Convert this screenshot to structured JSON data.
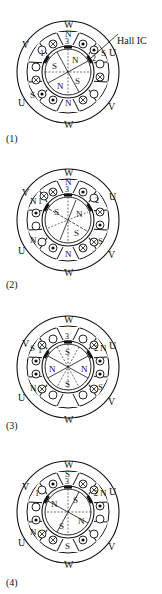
{
  "top_text": "",
  "hall_label": "Hall IC",
  "colors": {
    "ink": "#111111",
    "background": "#ffffff"
  },
  "panels": [
    {
      "caption": "(1)",
      "stator_labels": {
        "top": "W",
        "bottom": "W",
        "upper_left": "V",
        "lower_left": "U",
        "upper_right": "U",
        "lower_right": "V"
      },
      "pole_letters": {
        "top": "N",
        "bottom": "N",
        "upper_left": "",
        "lower_left": "S",
        "upper_right": "S",
        "lower_right": ""
      },
      "sensor_numbers": [
        "1",
        "2",
        "3"
      ],
      "rotor_poles": [
        "S",
        "N",
        "S",
        "N"
      ]
    },
    {
      "caption": "(2)",
      "stator_labels": {
        "top": "W",
        "bottom": "W",
        "upper_left": "V",
        "lower_left": "U",
        "upper_right": "U",
        "lower_right": "V"
      },
      "pole_letters": {
        "top": "N",
        "bottom": "N",
        "upper_left": "N",
        "lower_left": "N",
        "upper_right": "",
        "lower_right": "S"
      },
      "sensor_numbers": [
        "1",
        "2",
        "3"
      ],
      "rotor_poles": [
        "S",
        "N",
        "S",
        ""
      ]
    },
    {
      "caption": "(3)",
      "stator_labels": {
        "top": "W",
        "bottom": "W",
        "upper_left": "V",
        "lower_left": "U",
        "upper_right": "U",
        "lower_right": "V"
      },
      "pole_letters": {
        "top": "",
        "bottom": "",
        "upper_left": "S",
        "lower_left": "N",
        "upper_right": "N",
        "lower_right": "S"
      },
      "sensor_numbers": [
        "1",
        "2",
        "3"
      ],
      "rotor_poles": [
        "S",
        "N",
        "S",
        "N"
      ]
    },
    {
      "caption": "(4)",
      "stator_labels": {
        "top": "W",
        "bottom": "W",
        "upper_left": "V",
        "lower_left": "U",
        "upper_right": "U",
        "lower_right": "V"
      },
      "pole_letters": {
        "top": "S",
        "bottom": "S",
        "upper_left": "",
        "lower_left": "N",
        "upper_right": "N",
        "lower_right": ""
      },
      "sensor_numbers": [
        "1",
        "2",
        "3"
      ],
      "rotor_poles": [
        "S",
        "N",
        "S",
        "N"
      ]
    }
  ]
}
